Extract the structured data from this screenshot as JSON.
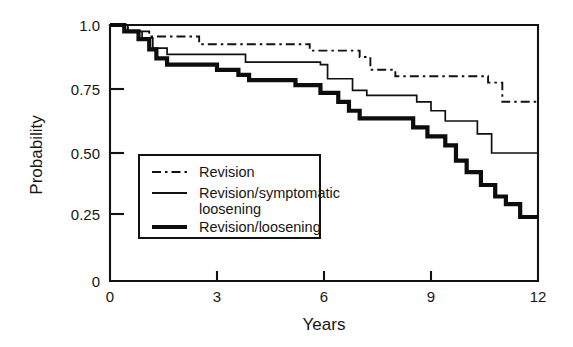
{
  "figure": {
    "background": "#ffffff",
    "ink_color": "#111111"
  },
  "axes": {
    "y_title": "Probability",
    "x_title": "Years",
    "y_ticks": [
      "1.0",
      "0.75",
      "0.50",
      "0.25",
      "0"
    ],
    "x_ticks": [
      "0",
      "3",
      "6",
      "9",
      "12"
    ]
  },
  "legend": {
    "items": [
      {
        "label": "Revision",
        "style": "dash-dot",
        "line_width": "thin"
      },
      {
        "label": "Revision/symptomatic",
        "label2": "loosening",
        "style": "solid",
        "line_width": "thin"
      },
      {
        "label": "Revision/loosening",
        "style": "solid",
        "line_width": "thick"
      }
    ]
  },
  "chart_data": {
    "type": "line",
    "subtype": "kaplan-meier-step",
    "title": "",
    "xlabel": "Years",
    "ylabel": "Probability",
    "xlim": [
      0,
      12
    ],
    "ylim": [
      0,
      1.0
    ],
    "xticks": [
      0,
      3,
      6,
      9,
      12
    ],
    "yticks": [
      0,
      0.25,
      0.5,
      0.75,
      1.0
    ],
    "grid": false,
    "legend_position": "center-left-inside",
    "series": [
      {
        "name": "Revision",
        "style": "dash-dot",
        "points": [
          [
            0.0,
            1.0
          ],
          [
            0.5,
            1.0
          ],
          [
            0.5,
            0.975
          ],
          [
            1.1,
            0.975
          ],
          [
            1.1,
            0.955
          ],
          [
            2.5,
            0.955
          ],
          [
            2.5,
            0.925
          ],
          [
            5.6,
            0.925
          ],
          [
            5.6,
            0.9
          ],
          [
            7.0,
            0.9
          ],
          [
            7.0,
            0.875
          ],
          [
            7.3,
            0.875
          ],
          [
            7.3,
            0.825
          ],
          [
            8.0,
            0.825
          ],
          [
            8.0,
            0.8
          ],
          [
            10.6,
            0.8
          ],
          [
            10.6,
            0.775
          ],
          [
            11.0,
            0.775
          ],
          [
            11.0,
            0.7
          ],
          [
            12.0,
            0.7
          ]
        ]
      },
      {
        "name": "Revision/symptomatic loosening",
        "style": "solid-thin",
        "points": [
          [
            0.0,
            1.0
          ],
          [
            0.5,
            1.0
          ],
          [
            0.5,
            0.975
          ],
          [
            0.9,
            0.975
          ],
          [
            0.9,
            0.95
          ],
          [
            1.2,
            0.95
          ],
          [
            1.2,
            0.91
          ],
          [
            1.6,
            0.91
          ],
          [
            1.6,
            0.885
          ],
          [
            3.8,
            0.885
          ],
          [
            3.8,
            0.855
          ],
          [
            5.9,
            0.855
          ],
          [
            5.9,
            0.845
          ],
          [
            6.1,
            0.845
          ],
          [
            6.1,
            0.79
          ],
          [
            6.8,
            0.79
          ],
          [
            6.8,
            0.745
          ],
          [
            7.2,
            0.745
          ],
          [
            7.2,
            0.725
          ],
          [
            8.6,
            0.725
          ],
          [
            8.6,
            0.7
          ],
          [
            9.0,
            0.7
          ],
          [
            9.0,
            0.665
          ],
          [
            9.4,
            0.665
          ],
          [
            9.4,
            0.625
          ],
          [
            10.3,
            0.625
          ],
          [
            10.3,
            0.575
          ],
          [
            10.7,
            0.575
          ],
          [
            10.7,
            0.5
          ],
          [
            12.0,
            0.5
          ]
        ]
      },
      {
        "name": "Revision/loosening",
        "style": "solid-thick",
        "points": [
          [
            0.0,
            1.0
          ],
          [
            0.4,
            1.0
          ],
          [
            0.4,
            0.975
          ],
          [
            0.8,
            0.975
          ],
          [
            0.8,
            0.945
          ],
          [
            1.1,
            0.945
          ],
          [
            1.1,
            0.905
          ],
          [
            1.3,
            0.905
          ],
          [
            1.3,
            0.87
          ],
          [
            1.6,
            0.87
          ],
          [
            1.6,
            0.845
          ],
          [
            3.0,
            0.845
          ],
          [
            3.0,
            0.825
          ],
          [
            3.6,
            0.825
          ],
          [
            3.6,
            0.805
          ],
          [
            3.9,
            0.805
          ],
          [
            3.9,
            0.785
          ],
          [
            5.2,
            0.785
          ],
          [
            5.2,
            0.765
          ],
          [
            5.9,
            0.765
          ],
          [
            5.9,
            0.735
          ],
          [
            6.4,
            0.735
          ],
          [
            6.4,
            0.7
          ],
          [
            6.7,
            0.7
          ],
          [
            6.7,
            0.665
          ],
          [
            7.0,
            0.665
          ],
          [
            7.0,
            0.635
          ],
          [
            8.5,
            0.635
          ],
          [
            8.5,
            0.6
          ],
          [
            8.9,
            0.6
          ],
          [
            8.9,
            0.565
          ],
          [
            9.4,
            0.565
          ],
          [
            9.4,
            0.53
          ],
          [
            9.7,
            0.53
          ],
          [
            9.7,
            0.47
          ],
          [
            10.0,
            0.47
          ],
          [
            10.0,
            0.425
          ],
          [
            10.4,
            0.425
          ],
          [
            10.4,
            0.375
          ],
          [
            10.8,
            0.375
          ],
          [
            10.8,
            0.33
          ],
          [
            11.1,
            0.33
          ],
          [
            11.1,
            0.3
          ],
          [
            11.5,
            0.3
          ],
          [
            11.5,
            0.25
          ],
          [
            12.0,
            0.25
          ]
        ]
      }
    ]
  }
}
